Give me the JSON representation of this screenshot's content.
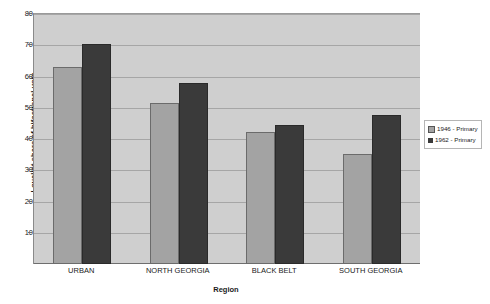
{
  "chart_data": {
    "type": "bar",
    "title": "",
    "xlabel": "Region",
    "ylabel": "Loyalist share of bifactional vote",
    "categories": [
      "URBAN",
      "NORTH GEORGIA",
      "BLACK BELT",
      "SOUTH GEORGIA"
    ],
    "series": [
      {
        "name": "1946 - Primary",
        "color": "#a3a3a3",
        "values": [
          63.2,
          51.4,
          42.1,
          35.2
        ]
      },
      {
        "name": "1962 - Primary",
        "color": "#3a3a3a",
        "values": [
          70.5,
          58.0,
          44.6,
          47.6
        ]
      }
    ],
    "ylim": [
      0,
      80
    ],
    "yticks": [
      10,
      20,
      30,
      40,
      50,
      60,
      70,
      80
    ],
    "ytick_labels": [
      "10",
      "20",
      "30",
      "40",
      "50",
      "60",
      "70",
      "80"
    ],
    "grid": true,
    "legend_position": "right",
    "plot_background": "#cfcfcf"
  }
}
